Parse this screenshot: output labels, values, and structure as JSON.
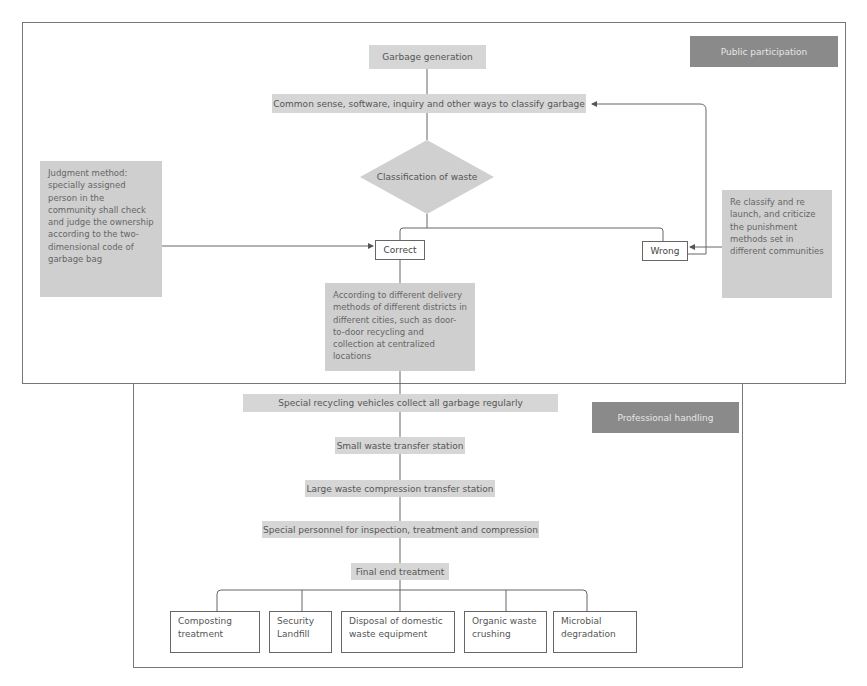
{
  "sections": {
    "public": {
      "label": "Public participation"
    },
    "professional": {
      "label": "Professional handling"
    }
  },
  "public_flow": {
    "generation": "Garbage generation",
    "classify_ways": "Common sense, software, inquiry and other ways to classify garbage",
    "decision": "Classification of waste",
    "correct": "Correct",
    "wrong": "Wrong",
    "judgment_note": "Judgment method: specially assigned person in the community shall check and judge the ownership according to the two-dimensional code of garbage bag",
    "reclassify_note": "Re classify and re launch, and criticize the punishment methods set in different communities",
    "delivery_note": "According to different delivery methods of different districts in different cities, such as door-to-door recycling and collection at centralized locations"
  },
  "professional_flow": {
    "steps": [
      "Special recycling vehicles collect all garbage regularly",
      "Small waste transfer station",
      "Large waste compression transfer station",
      "Special personnel for inspection, treatment and compression",
      "Final end treatment"
    ],
    "end_treatments": [
      "Composting treatment",
      "Security Landfill",
      "Disposal of domestic waste equipment",
      "Organic waste crushing",
      "Microbial degradation"
    ]
  }
}
